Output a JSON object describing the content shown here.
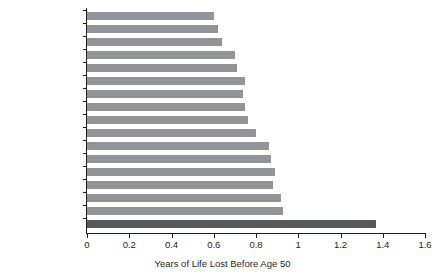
{
  "chart_data": {
    "type": "bar",
    "orientation": "horizontal",
    "title": "",
    "xlabel": "Years of Life Lost Before Age 50",
    "ylabel": "",
    "xlim": [
      0,
      1.6
    ],
    "xticks": [
      "0",
      "0.2",
      "0.4",
      "0.6",
      "0.8",
      "1",
      "1.2",
      "1.4",
      "1.6"
    ],
    "xtick_values": [
      0,
      0.2,
      0.4,
      0.6,
      0.8,
      1.0,
      1.2,
      1.4,
      1.6
    ],
    "grid": false,
    "legend": "none",
    "categories": [
      "Sweden",
      "Netherlands",
      "Japan",
      "Italy",
      "Switzerland",
      "Germany",
      "Spain",
      "Norway",
      "Austria",
      "Denmark",
      "France",
      "Australia",
      "Portugal",
      "United Kingdom",
      "Canada",
      "Finland",
      "United States"
    ],
    "values": [
      0.6,
      0.62,
      0.64,
      0.7,
      0.71,
      0.75,
      0.74,
      0.75,
      0.76,
      0.8,
      0.86,
      0.87,
      0.89,
      0.88,
      0.92,
      0.93,
      1.37
    ],
    "highlight_category": "United States",
    "bar_color": "#929497",
    "highlight_color": "#58595b"
  }
}
